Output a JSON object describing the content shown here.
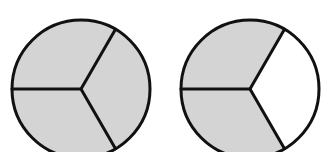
{
  "diagram": {
    "type": "fraction-circles",
    "colors": {
      "shaded": "#d4d4d4",
      "unshaded": "#ffffff",
      "stroke": "#111111",
      "background": "#ffffff"
    },
    "stroke_width": 3,
    "circles": [
      {
        "id": "circle-left",
        "cx": 81,
        "cy": 89,
        "r": 69,
        "divisions": 3,
        "divider_angles_deg": [
          180,
          -60,
          60
        ],
        "sectors": [
          {
            "from_deg": -60,
            "to_deg": 60,
            "shaded": true
          },
          {
            "from_deg": 60,
            "to_deg": 180,
            "shaded": true
          },
          {
            "from_deg": 180,
            "to_deg": 300,
            "shaded": true
          }
        ]
      },
      {
        "id": "circle-right",
        "cx": 250,
        "cy": 89,
        "r": 69,
        "divisions": 3,
        "divider_angles_deg": [
          180,
          -60,
          60
        ],
        "sectors": [
          {
            "from_deg": -60,
            "to_deg": 60,
            "shaded": false
          },
          {
            "from_deg": 60,
            "to_deg": 180,
            "shaded": true
          },
          {
            "from_deg": 180,
            "to_deg": 300,
            "shaded": true
          }
        ]
      }
    ]
  }
}
